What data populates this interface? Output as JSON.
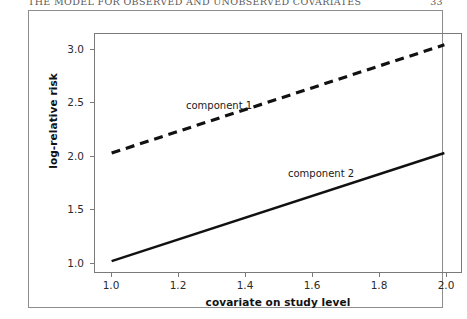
{
  "page": {
    "header_text": "THE MODEL FOR OBSERVED AND UNOBSERVED COVARIATES",
    "header_number": "33"
  },
  "chart_data": {
    "type": "line",
    "title": "",
    "xlabel": "covariate on study level",
    "ylabel": "log-relative risk",
    "xlim": [
      0.95,
      2.05
    ],
    "ylim": [
      0.9,
      3.1
    ],
    "xticks": [
      "1.0",
      "1.2",
      "1.4",
      "1.6",
      "1.8",
      "2.0"
    ],
    "xtick_values": [
      1.0,
      1.2,
      1.4,
      1.6,
      1.8,
      2.0
    ],
    "yticks": [
      "1.0",
      "1.5",
      "2.0",
      "2.5",
      "3.0"
    ],
    "ytick_values": [
      1.0,
      1.5,
      2.0,
      2.5,
      3.0
    ],
    "grid": false,
    "legend": "inline-annotations",
    "series": [
      {
        "name": "component 1",
        "style": "dashed",
        "color": "#111111",
        "x": [
          1.0,
          2.0
        ],
        "values": [
          2.0,
          3.0
        ],
        "slope": 1.0,
        "intercept": 1.0,
        "annotation": "component 1"
      },
      {
        "name": "component 2",
        "style": "solid",
        "color": "#111111",
        "x": [
          1.0,
          2.0
        ],
        "values": [
          1.0,
          2.0
        ],
        "slope": 1.0,
        "intercept": 0.0,
        "annotation": "component 2"
      }
    ]
  }
}
